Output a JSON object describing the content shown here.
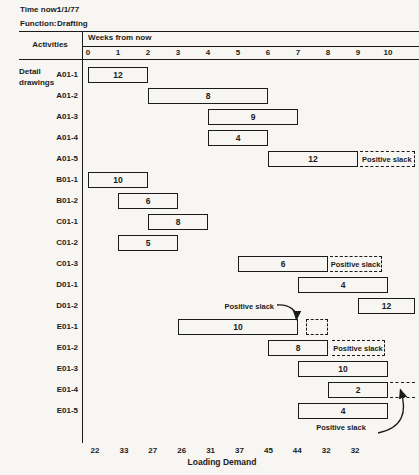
{
  "colors": {
    "ink": "#1b1b1b",
    "paper": "#f7f6f2"
  },
  "meta": {
    "time_now_label": "Time now:",
    "time_now_value": "1/1/77",
    "function_label": "Function:",
    "function_value": "Drafting"
  },
  "header": {
    "activities_label": "Activities",
    "weeks_label": "Weeks from now",
    "week_ticks": [
      "0",
      "1",
      "2",
      "3",
      "4",
      "5",
      "6",
      "7",
      "8",
      "9",
      "10"
    ]
  },
  "group": {
    "line1": "Detail",
    "line2": "drawings"
  },
  "rows": [
    {
      "label": "A01-1",
      "start": 0,
      "end": 2,
      "value": "12"
    },
    {
      "label": "A01-2",
      "start": 2,
      "end": 6,
      "value": "8"
    },
    {
      "label": "A01-3",
      "start": 4,
      "end": 7,
      "value": "9"
    },
    {
      "label": "A01-4",
      "start": 4,
      "end": 6,
      "value": "4"
    },
    {
      "label": "A01-5",
      "start": 6,
      "end": 9,
      "value": "12",
      "slack": {
        "style": "band",
        "from": 9.05,
        "to": 10.9,
        "label": "Positive slack"
      }
    },
    {
      "label": "B01-1",
      "start": 0,
      "end": 2,
      "value": "10"
    },
    {
      "label": "B01-2",
      "start": 1,
      "end": 3,
      "value": "6"
    },
    {
      "label": "C01-1",
      "start": 2,
      "end": 4,
      "value": "8"
    },
    {
      "label": "C01-2",
      "start": 1,
      "end": 3,
      "value": "5"
    },
    {
      "label": "C01-3",
      "start": 5,
      "end": 8,
      "value": "6",
      "slack": {
        "style": "band",
        "from": 8.07,
        "to": 9.8,
        "label": "Positive slack"
      }
    },
    {
      "label": "D01-1",
      "start": 7,
      "end": 10,
      "value": "4"
    },
    {
      "label": "D01-2",
      "start": 9,
      "end": 10.9,
      "value": "12"
    },
    {
      "label": "E01-1",
      "start": 3,
      "end": 7,
      "value": "10",
      "slack": {
        "style": "box",
        "from": 7.25,
        "to": 8.0,
        "label": ""
      }
    },
    {
      "label": "E01-2",
      "start": 6,
      "end": 8,
      "value": "8",
      "slack": {
        "style": "band",
        "from": 8.13,
        "to": 9.9,
        "label": "Positive slack"
      }
    },
    {
      "label": "E01-3",
      "start": 7,
      "end": 10,
      "value": "10"
    },
    {
      "label": "E01-4",
      "start": 8,
      "end": 10,
      "value": "2",
      "slack": {
        "style": "lines",
        "from": 10.07,
        "to": 10.9,
        "label": ""
      }
    },
    {
      "label": "E01-5",
      "start": 7,
      "end": 10,
      "value": "4"
    }
  ],
  "callouts": {
    "e01_1": {
      "text": "Positive slack"
    },
    "e01_4": {
      "text": "Positive slack"
    }
  },
  "footer": {
    "axis_label": "Loading Demand",
    "demand_values": [
      "22",
      "33",
      "27",
      "26",
      "31",
      "37",
      "45",
      "44",
      "32",
      "32"
    ]
  },
  "chart_data": {
    "type": "bar",
    "subtype": "gantt-loading-chart",
    "x_axis": {
      "label": "Weeks from now",
      "ticks": [
        0,
        1,
        2,
        3,
        4,
        5,
        6,
        7,
        8,
        9,
        10
      ]
    },
    "group": "Detail drawings",
    "activities": [
      {
        "name": "A01-1",
        "start_week": 0,
        "end_week": 2,
        "weekly_load": 12,
        "positive_slack": false
      },
      {
        "name": "A01-2",
        "start_week": 2,
        "end_week": 6,
        "weekly_load": 8,
        "positive_slack": false
      },
      {
        "name": "A01-3",
        "start_week": 4,
        "end_week": 7,
        "weekly_load": 9,
        "positive_slack": false
      },
      {
        "name": "A01-4",
        "start_week": 4,
        "end_week": 6,
        "weekly_load": 4,
        "positive_slack": false
      },
      {
        "name": "A01-5",
        "start_week": 6,
        "end_week": 9,
        "weekly_load": 12,
        "positive_slack": true
      },
      {
        "name": "B01-1",
        "start_week": 0,
        "end_week": 2,
        "weekly_load": 10,
        "positive_slack": false
      },
      {
        "name": "B01-2",
        "start_week": 1,
        "end_week": 3,
        "weekly_load": 6,
        "positive_slack": false
      },
      {
        "name": "C01-1",
        "start_week": 2,
        "end_week": 4,
        "weekly_load": 8,
        "positive_slack": false
      },
      {
        "name": "C01-2",
        "start_week": 1,
        "end_week": 3,
        "weekly_load": 5,
        "positive_slack": false
      },
      {
        "name": "C01-3",
        "start_week": 5,
        "end_week": 8,
        "weekly_load": 6,
        "positive_slack": true
      },
      {
        "name": "D01-1",
        "start_week": 7,
        "end_week": 10,
        "weekly_load": 4,
        "positive_slack": false
      },
      {
        "name": "D01-2",
        "start_week": 9,
        "end_week": 11,
        "weekly_load": 12,
        "positive_slack": false
      },
      {
        "name": "E01-1",
        "start_week": 3,
        "end_week": 7,
        "weekly_load": 10,
        "positive_slack": true
      },
      {
        "name": "E01-2",
        "start_week": 6,
        "end_week": 8,
        "weekly_load": 8,
        "positive_slack": true
      },
      {
        "name": "E01-3",
        "start_week": 7,
        "end_week": 10,
        "weekly_load": 10,
        "positive_slack": false
      },
      {
        "name": "E01-4",
        "start_week": 8,
        "end_week": 10,
        "weekly_load": 2,
        "positive_slack": true
      },
      {
        "name": "E01-5",
        "start_week": 7,
        "end_week": 10,
        "weekly_load": 4,
        "positive_slack": false
      }
    ],
    "loading_demand": {
      "label": "Loading Demand",
      "weeks": [
        1,
        2,
        3,
        4,
        5,
        6,
        7,
        8,
        9,
        10
      ],
      "values": [
        22,
        33,
        27,
        26,
        31,
        37,
        45,
        44,
        32,
        32
      ]
    }
  }
}
